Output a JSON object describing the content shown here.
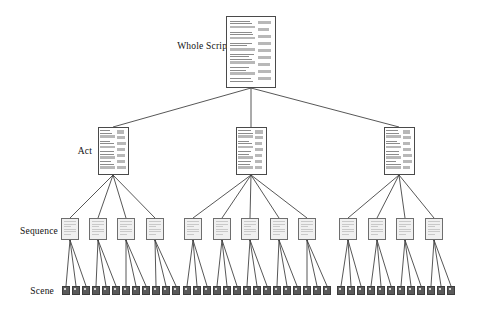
{
  "diagram": {
    "background_color": "#ffffff",
    "edge_color": "#444444",
    "levels": [
      {
        "id": "whole-script",
        "label": "Whole Script",
        "label_x": 178,
        "label_y": 41,
        "label_font_size": 9.5,
        "node_type": "document-page",
        "node_count": 1,
        "node_width": 50,
        "node_height": 72,
        "node_y": 16,
        "node_fill": "#ffffff",
        "node_stroke": "#4a4a4a",
        "nodes": [
          {
            "cx": 251
          }
        ]
      },
      {
        "id": "act",
        "label": "Act",
        "label_x": 72,
        "label_y": 148,
        "label_font_size": 9.5,
        "node_type": "document-page",
        "node_count": 3,
        "node_width": 31,
        "node_height": 48,
        "node_y": 127,
        "node_fill": "#ffffff",
        "node_stroke": "#4a4a4a",
        "nodes": [
          {
            "cx": 113
          },
          {
            "cx": 251
          },
          {
            "cx": 399
          }
        ]
      },
      {
        "id": "sequence",
        "label": "Sequence",
        "label_x": 16,
        "label_y": 227,
        "label_font_size": 9.5,
        "node_type": "small-square",
        "node_count": 13,
        "node_width": 18,
        "node_height": 22,
        "node_y": 218,
        "node_fill": "#f0f0f0",
        "node_stroke": "#6e6e6e",
        "nodes": [
          {
            "cx": 70
          },
          {
            "cx": 98
          },
          {
            "cx": 126
          },
          {
            "cx": 155
          },
          {
            "cx": 193
          },
          {
            "cx": 222
          },
          {
            "cx": 250
          },
          {
            "cx": 279
          },
          {
            "cx": 307
          },
          {
            "cx": 348
          },
          {
            "cx": 377
          },
          {
            "cx": 405
          },
          {
            "cx": 434
          }
        ]
      },
      {
        "id": "scene",
        "label": "Scene",
        "label_x": 22,
        "label_y": 288,
        "label_font_size": 9.5,
        "node_type": "dark-square",
        "node_count": 39,
        "node_width": 8,
        "node_height": 9,
        "node_y": 286,
        "node_fill": "#5a5a5a",
        "node_stroke": "#3d3d3d",
        "nodes": [
          {
            "cx": 66
          },
          {
            "cx": 76
          },
          {
            "cx": 86
          },
          {
            "cx": 96
          },
          {
            "cx": 106
          },
          {
            "cx": 116
          },
          {
            "cx": 126
          },
          {
            "cx": 136
          },
          {
            "cx": 146
          },
          {
            "cx": 156
          },
          {
            "cx": 166
          },
          {
            "cx": 176
          },
          {
            "cx": 187
          },
          {
            "cx": 197
          },
          {
            "cx": 207
          },
          {
            "cx": 217
          },
          {
            "cx": 227
          },
          {
            "cx": 237
          },
          {
            "cx": 247
          },
          {
            "cx": 257
          },
          {
            "cx": 267
          },
          {
            "cx": 277
          },
          {
            "cx": 287
          },
          {
            "cx": 297
          },
          {
            "cx": 307
          },
          {
            "cx": 317
          },
          {
            "cx": 327
          },
          {
            "cx": 341
          },
          {
            "cx": 351
          },
          {
            "cx": 361
          },
          {
            "cx": 371
          },
          {
            "cx": 381
          },
          {
            "cx": 391
          },
          {
            "cx": 401
          },
          {
            "cx": 411
          },
          {
            "cx": 421
          },
          {
            "cx": 431
          },
          {
            "cx": 441
          },
          {
            "cx": 451
          }
        ]
      }
    ],
    "edges": {
      "whole_script_to_act": [
        {
          "from": 0,
          "to": 0
        },
        {
          "from": 0,
          "to": 1
        },
        {
          "from": 0,
          "to": 2
        }
      ],
      "act_to_sequence": [
        {
          "from": 0,
          "to": [
            0,
            1,
            2,
            3
          ]
        },
        {
          "from": 1,
          "to": [
            4,
            5,
            6,
            7,
            8
          ]
        },
        {
          "from": 2,
          "to": [
            9,
            10,
            11,
            12
          ]
        }
      ],
      "sequence_to_scene": [
        {
          "from": 0,
          "to": [
            0,
            1,
            2
          ]
        },
        {
          "from": 1,
          "to": [
            3,
            4,
            5
          ]
        },
        {
          "from": 2,
          "to": [
            6,
            7,
            8
          ]
        },
        {
          "from": 3,
          "to": [
            9,
            10,
            11
          ]
        },
        {
          "from": 4,
          "to": [
            12,
            13,
            14
          ]
        },
        {
          "from": 5,
          "to": [
            15,
            16,
            17
          ]
        },
        {
          "from": 6,
          "to": [
            18,
            19,
            20
          ]
        },
        {
          "from": 7,
          "to": [
            21,
            22,
            23
          ]
        },
        {
          "from": 8,
          "to": [
            24,
            25,
            26
          ]
        },
        {
          "from": 9,
          "to": [
            27,
            28,
            29
          ]
        },
        {
          "from": 10,
          "to": [
            30,
            31,
            32
          ]
        },
        {
          "from": 11,
          "to": [
            33,
            34,
            35
          ]
        },
        {
          "from": 12,
          "to": [
            36,
            37,
            38
          ]
        }
      ]
    },
    "page_glyph": {
      "whole_script_main_lines": [
        1,
        1,
        0,
        1,
        1,
        0,
        1,
        1,
        0,
        1,
        1,
        1,
        0,
        1,
        1,
        0,
        1,
        1
      ],
      "whole_script_side_blocks": 9,
      "act_main_lines": [
        1,
        1,
        0,
        1,
        1,
        0,
        1,
        1,
        0,
        1,
        1,
        0
      ],
      "act_side_blocks": 7
    }
  }
}
